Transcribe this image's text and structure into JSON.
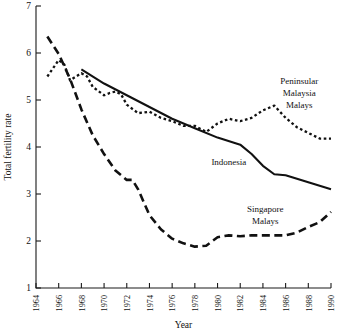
{
  "chart_data": {
    "type": "line",
    "title": "",
    "xlabel": "Year",
    "ylabel": "Total fertility rate",
    "xlim": [
      1964,
      1990
    ],
    "ylim": [
      1,
      7
    ],
    "grid": false,
    "legend_position": "inline-annotations",
    "xticks": [
      1964,
      1966,
      1968,
      1970,
      1972,
      1974,
      1976,
      1978,
      1980,
      1982,
      1984,
      1986,
      1988,
      1990
    ],
    "yticks": [
      1,
      2,
      3,
      4,
      5,
      6,
      7
    ],
    "series": [
      {
        "name": "Peninsular Malaysia Malays",
        "style": "dotted",
        "label_lines": [
          "Peninsular",
          "Malaysia",
          "Malays"
        ],
        "x": [
          1965,
          1966,
          1966.5,
          1967,
          1968,
          1968.5,
          1969,
          1970,
          1970.5,
          1971,
          1971.5,
          1972,
          1973,
          1974,
          1975,
          1976,
          1977,
          1978,
          1979,
          1980,
          1981,
          1982,
          1983,
          1984,
          1985,
          1986,
          1987,
          1988,
          1989,
          1990
        ],
        "y": [
          5.5,
          5.85,
          5.75,
          5.42,
          5.57,
          5.5,
          5.28,
          5.1,
          5.15,
          5.18,
          5.12,
          4.9,
          4.72,
          4.75,
          4.62,
          4.55,
          4.45,
          4.45,
          4.32,
          4.5,
          4.6,
          4.55,
          4.62,
          4.78,
          4.88,
          4.62,
          4.42,
          4.3,
          4.18,
          4.18
        ]
      },
      {
        "name": "Indonesia",
        "style": "solid",
        "label_lines": [
          "Indonesia"
        ],
        "x": [
          1968,
          1970,
          1972,
          1974,
          1976,
          1978,
          1980,
          1982,
          1983,
          1984,
          1985,
          1986,
          1988,
          1990
        ],
        "y": [
          5.65,
          5.35,
          5.1,
          4.85,
          4.6,
          4.4,
          4.2,
          4.05,
          3.85,
          3.6,
          3.42,
          3.4,
          3.25,
          3.1
        ]
      },
      {
        "name": "Singapore Malays",
        "style": "dashed",
        "label_lines": [
          "Singapore",
          "Malays"
        ],
        "x": [
          1965,
          1966,
          1967,
          1968,
          1969,
          1970,
          1971,
          1972,
          1972.5,
          1973,
          1974,
          1975,
          1976,
          1977,
          1978,
          1979,
          1980,
          1981,
          1982,
          1983,
          1984,
          1985,
          1986,
          1987,
          1988,
          1989,
          1990
        ],
        "y": [
          6.35,
          5.98,
          5.45,
          4.8,
          4.25,
          3.85,
          3.5,
          3.3,
          3.3,
          3.1,
          2.55,
          2.25,
          2.05,
          1.95,
          1.88,
          1.9,
          2.08,
          2.12,
          2.1,
          2.12,
          2.12,
          2.12,
          2.12,
          2.18,
          2.3,
          2.4,
          2.62
        ]
      }
    ],
    "annotations": [
      {
        "text": "Peninsular",
        "x": 1987.2,
        "y": 5.35
      },
      {
        "text": "Malaysia",
        "x": 1987.2,
        "y": 5.08
      },
      {
        "text": "Malays",
        "x": 1987.2,
        "y": 4.82
      },
      {
        "text": "Indonesia",
        "x": 1981.0,
        "y": 3.62
      },
      {
        "text": "Singapore",
        "x": 1984.2,
        "y": 2.62
      },
      {
        "text": "Malays",
        "x": 1984.2,
        "y": 2.36
      }
    ]
  }
}
